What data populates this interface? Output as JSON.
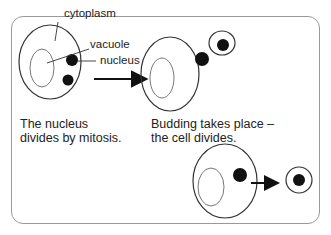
{
  "labels": {
    "cytoplasm": "cytoplasm",
    "vacuole": "vacuole",
    "nucleus": "nucleus"
  },
  "captions": {
    "step1_line1": "The nucleus",
    "step1_line2": "divides by mitosis.",
    "step2_line1": "Budding takes place –",
    "step2_line2": "the cell divides."
  },
  "colors": {
    "outline": "#333333",
    "nucleus": "#111111",
    "frame": "#9a9a9a"
  }
}
